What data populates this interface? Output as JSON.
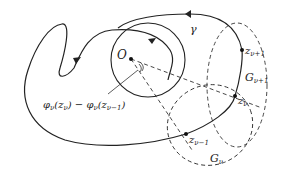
{
  "diagram": {
    "curve_label": "γ",
    "origin_label": "O",
    "points": {
      "z_next": {
        "base": "z",
        "sub": "ν+1"
      },
      "z_cur": {
        "base": "z",
        "sub": "ν"
      },
      "z_prev": {
        "base": "z",
        "sub": "ν−1"
      }
    },
    "regions": {
      "G_next": {
        "base": "G",
        "sub": "ν+1"
      },
      "G_cur": {
        "base": "G",
        "sub": "ν"
      }
    },
    "angle_label": {
      "phi1": "φ",
      "sub1": "ν",
      "arg1": "(z",
      "arg1sub": "ν",
      "close1": ")",
      "minus": " − ",
      "phi2": "φ",
      "sub2": "ν",
      "arg2": "(z",
      "arg2sub": "ν−1",
      "close2": ")"
    },
    "colors": {
      "stroke": "#222222",
      "background": "#ffffff"
    }
  }
}
